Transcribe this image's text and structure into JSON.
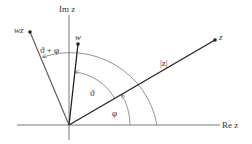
{
  "diagram": {
    "axes": {
      "real_label": "Re z",
      "imag_label": "Im z"
    },
    "points": {
      "z": {
        "label": "z",
        "angle_deg": 30
      },
      "w": {
        "label": "w",
        "angle_deg": 83
      },
      "wz": {
        "label": "wz",
        "angle_deg": 113
      }
    },
    "annotations": {
      "modulus": "|z|",
      "theta": "ϑ",
      "phi": "φ",
      "theta_plus_phi": "ϑ + φ"
    },
    "colors": {
      "line": "#222222",
      "axis": "#555555",
      "arc": "#666666",
      "text": "#333333"
    }
  }
}
